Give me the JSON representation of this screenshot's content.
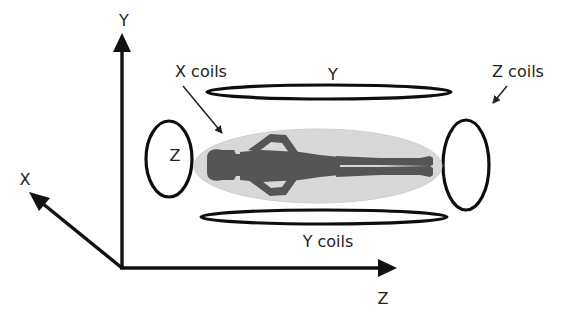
{
  "diagram": {
    "axes": {
      "x_label": "X",
      "y_label": "Y",
      "z_label": "Z"
    },
    "coils": {
      "x_coils_label": "X coils",
      "y_top_label": "Y",
      "y_bottom_label": "Y coils",
      "z_left_label": "Z",
      "z_right_label": "Z coils"
    },
    "colors": {
      "line": "#111111",
      "text": "#231f20",
      "bore_fill": "#d8d8d8",
      "body_fill": "#555555"
    }
  }
}
